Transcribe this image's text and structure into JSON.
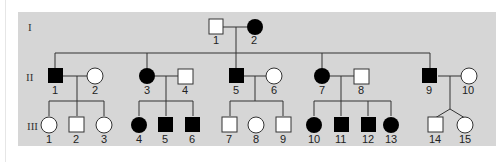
{
  "pedigree": {
    "background_color": "#d6d6d6",
    "affected_color": "#000000",
    "unaffected_color": "#ffffff",
    "generations": [
      {
        "label": "I",
        "individuals": [
          {
            "id": "1",
            "sex": "male",
            "affected": false
          },
          {
            "id": "2",
            "sex": "female",
            "affected": true
          }
        ]
      },
      {
        "label": "II",
        "individuals": [
          {
            "id": "1",
            "sex": "male",
            "affected": true
          },
          {
            "id": "2",
            "sex": "female",
            "affected": false
          },
          {
            "id": "3",
            "sex": "female",
            "affected": true
          },
          {
            "id": "4",
            "sex": "male",
            "affected": false
          },
          {
            "id": "5",
            "sex": "male",
            "affected": true
          },
          {
            "id": "6",
            "sex": "female",
            "affected": false
          },
          {
            "id": "7",
            "sex": "female",
            "affected": true
          },
          {
            "id": "8",
            "sex": "male",
            "affected": false
          },
          {
            "id": "9",
            "sex": "male",
            "affected": true
          },
          {
            "id": "10",
            "sex": "female",
            "affected": false
          }
        ]
      },
      {
        "label": "III",
        "individuals": [
          {
            "id": "1",
            "sex": "female",
            "affected": false
          },
          {
            "id": "2",
            "sex": "male",
            "affected": false
          },
          {
            "id": "3",
            "sex": "female",
            "affected": false
          },
          {
            "id": "4",
            "sex": "female",
            "affected": true
          },
          {
            "id": "5",
            "sex": "male",
            "affected": true
          },
          {
            "id": "6",
            "sex": "male",
            "affected": true
          },
          {
            "id": "7",
            "sex": "male",
            "affected": false
          },
          {
            "id": "8",
            "sex": "female",
            "affected": false
          },
          {
            "id": "9",
            "sex": "male",
            "affected": false
          },
          {
            "id": "10",
            "sex": "female",
            "affected": true
          },
          {
            "id": "11",
            "sex": "male",
            "affected": true
          },
          {
            "id": "12",
            "sex": "male",
            "affected": true
          },
          {
            "id": "13",
            "sex": "female",
            "affected": true
          },
          {
            "id": "14",
            "sex": "male",
            "affected": false,
            "twin": "dizygotic"
          },
          {
            "id": "15",
            "sex": "female",
            "affected": false,
            "twin": "dizygotic"
          }
        ]
      }
    ]
  },
  "labels": {
    "gen_I": "I",
    "gen_II": "II",
    "gen_III": "III",
    "I_1": "1",
    "I_2": "2",
    "II_1": "1",
    "II_2": "2",
    "II_3": "3",
    "II_4": "4",
    "II_5": "5",
    "II_6": "6",
    "II_7": "7",
    "II_8": "8",
    "II_9": "9",
    "II_10": "10",
    "III_1": "1",
    "III_2": "2",
    "III_3": "3",
    "III_4": "4",
    "III_5": "5",
    "III_6": "6",
    "III_7": "7",
    "III_8": "8",
    "III_9": "9",
    "III_10": "10",
    "III_11": "11",
    "III_12": "12",
    "III_13": "13",
    "III_14": "14",
    "III_15": "15"
  }
}
